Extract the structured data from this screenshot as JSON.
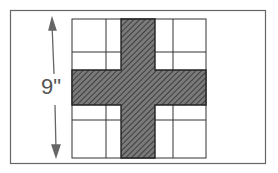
{
  "diagram": {
    "type": "quilt-block-cross",
    "dimension_label": "9\"",
    "colors": {
      "frame": "#666666",
      "grid_line": "#333333",
      "cross_fill": "#6a6a6a",
      "hatch": "#2e2e2e",
      "arrow": "#666666"
    }
  }
}
